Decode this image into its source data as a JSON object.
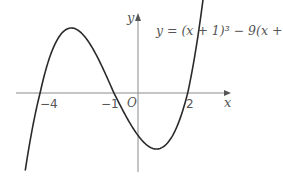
{
  "figure": {
    "equation": "y = (x + 1)³ − 9(x + 1)",
    "axis_x_label": "x",
    "axis_y_label": "y",
    "origin_label": "O",
    "tick_labels": [
      "−4",
      "−1",
      "2"
    ],
    "colors": {
      "curve": "#2a2a2a",
      "axes": "#8a8a8a",
      "text": "#555555"
    }
  },
  "chart_data": {
    "type": "line",
    "xlabel": "x",
    "ylabel": "y",
    "x_intercepts": [
      -4,
      -1,
      2
    ],
    "local_max": {
      "x": -2.732,
      "y": 10.39
    },
    "local_min": {
      "x": 0.732,
      "y": -10.39
    },
    "x_range": [
      -4.6,
      2.7
    ],
    "grid": false
  }
}
